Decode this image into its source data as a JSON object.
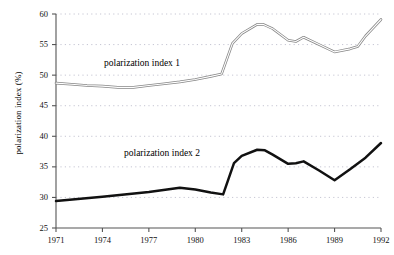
{
  "chart_data": {
    "type": "line",
    "title": "",
    "xlabel": "",
    "ylabel": "polarization index (%)",
    "xlim": [
      1971,
      1992
    ],
    "ylim": [
      25,
      60
    ],
    "grid": true,
    "grid_style": "dotted-horizontal",
    "legend_position": "inline-annotation",
    "xticks": [
      1971,
      1974,
      1977,
      1980,
      1983,
      1986,
      1989,
      1992
    ],
    "xtick_labels": [
      "1971",
      "1974",
      "1977",
      "1980",
      "1983",
      "1986",
      "1989",
      "1992"
    ],
    "yticks": [
      25,
      30,
      35,
      40,
      45,
      50,
      55,
      60
    ],
    "ytick_labels": [
      "25",
      "30",
      "35",
      "40",
      "45",
      "50",
      "55",
      "60"
    ],
    "series": [
      {
        "name": "polarization index 1",
        "style": "thin-double-outline",
        "color": "#808080",
        "x": [
          1971,
          1972,
          1973,
          1974,
          1975,
          1976,
          1977,
          1978,
          1979,
          1980,
          1981,
          1981.7,
          1982.4,
          1983,
          1984,
          1984.4,
          1985,
          1986,
          1986.5,
          1987,
          1988,
          1989,
          1990,
          1990.5,
          1991,
          1992
        ],
        "values": [
          48.7,
          48.5,
          48.3,
          48.2,
          48.0,
          48.0,
          48.3,
          48.6,
          48.9,
          49.3,
          49.8,
          50.2,
          55.2,
          56.8,
          58.3,
          58.3,
          57.6,
          55.7,
          55.5,
          56.2,
          55.0,
          53.8,
          54.3,
          54.7,
          56.4,
          59.1
        ]
      },
      {
        "name": "polarization index 2",
        "style": "thick-solid",
        "color": "#111111",
        "x": [
          1971,
          1974,
          1977,
          1979,
          1980,
          1981,
          1981.8,
          1982.5,
          1983,
          1984,
          1984.5,
          1985,
          1986,
          1986.5,
          1987,
          1988,
          1989,
          1990,
          1991,
          1992
        ],
        "values": [
          29.4,
          30.1,
          30.9,
          31.6,
          31.3,
          30.8,
          30.5,
          35.6,
          36.8,
          37.8,
          37.7,
          37.0,
          35.5,
          35.6,
          35.9,
          34.4,
          32.8,
          34.6,
          36.5,
          38.9
        ]
      }
    ],
    "annotations": [
      {
        "text": "polarization index 1",
        "x": 1976.5,
        "y": 52.2
      },
      {
        "text": "polarization index 2",
        "x": 1978.0,
        "y": 36.5
      }
    ]
  },
  "axes": {
    "y_axis_title": "polarization index (%)"
  },
  "colors": {
    "axis": "#555555",
    "grid": "#b8b8c8",
    "series_1": "#808080",
    "series_2": "#111111",
    "text": "#111111",
    "background": "#ffffff"
  }
}
